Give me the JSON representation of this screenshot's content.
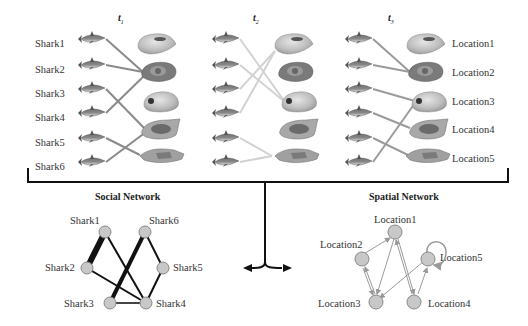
{
  "time_panels": [
    {
      "label": "t",
      "sub": "1"
    },
    {
      "label": "t",
      "sub": "2"
    },
    {
      "label": "t",
      "sub": "3"
    }
  ],
  "sharks": [
    "Shark1",
    "Shark2",
    "Shark3",
    "Shark4",
    "Shark5",
    "Shark6"
  ],
  "locations": [
    "Location1",
    "Location2",
    "Location3",
    "Location4",
    "Location5"
  ],
  "assignments": {
    "t1": [
      {
        "shark": "Shark1",
        "location": "Location2"
      },
      {
        "shark": "Shark2",
        "location": "Location2"
      },
      {
        "shark": "Shark3",
        "location": "Location4"
      },
      {
        "shark": "Shark4",
        "location": "Location2"
      },
      {
        "shark": "Shark5",
        "location": "Location5"
      },
      {
        "shark": "Shark6",
        "location": "Location4"
      }
    ],
    "t2": [
      {
        "shark": "Shark1",
        "location": "Location3"
      },
      {
        "shark": "Shark2",
        "location": "Location3"
      },
      {
        "shark": "Shark3",
        "location": "Location1"
      },
      {
        "shark": "Shark4",
        "location": "Location1"
      },
      {
        "shark": "Shark5",
        "location": "Location5"
      },
      {
        "shark": "Shark6",
        "location": "Location5"
      }
    ],
    "t3": [
      {
        "shark": "Shark1",
        "location": "Location2"
      },
      {
        "shark": "Shark2",
        "location": "Location2"
      },
      {
        "shark": "Shark3",
        "location": "Location3"
      },
      {
        "shark": "Shark4",
        "location": "Location4"
      },
      {
        "shark": "Shark5",
        "location": "Location5"
      },
      {
        "shark": "Shark6",
        "location": "Location3"
      }
    ]
  },
  "social_network": {
    "title": "Social Network",
    "nodes": [
      "Shark1",
      "Shark2",
      "Shark3",
      "Shark4",
      "Shark5",
      "Shark6"
    ],
    "edges": [
      {
        "from": "Shark1",
        "to": "Shark2",
        "weight": 3
      },
      {
        "from": "Shark1",
        "to": "Shark4",
        "weight": 1
      },
      {
        "from": "Shark2",
        "to": "Shark4",
        "weight": 1
      },
      {
        "from": "Shark3",
        "to": "Shark6",
        "weight": 2
      },
      {
        "from": "Shark3",
        "to": "Shark4",
        "weight": 1
      },
      {
        "from": "Shark6",
        "to": "Shark5",
        "weight": 1
      },
      {
        "from": "Shark5",
        "to": "Shark4",
        "weight": 1
      }
    ]
  },
  "spatial_network": {
    "title": "Spatial Network",
    "nodes": [
      "Location1",
      "Location2",
      "Location3",
      "Location4",
      "Location5"
    ],
    "edges": [
      {
        "from": "Location2",
        "to": "Location1"
      },
      {
        "from": "Location2",
        "to": "Location3"
      },
      {
        "from": "Location3",
        "to": "Location2"
      },
      {
        "from": "Location1",
        "to": "Location3"
      },
      {
        "from": "Location1",
        "to": "Location4"
      },
      {
        "from": "Location4",
        "to": "Location1"
      },
      {
        "from": "Location5",
        "to": "Location3"
      },
      {
        "from": "Location4",
        "to": "Location5"
      },
      {
        "from": "Location5",
        "to": "Location5"
      }
    ]
  },
  "colors": {
    "t1_link": "#8a8a8a",
    "t2_link": "#cfcfcf",
    "t3_link": "#9a9a9a",
    "node_fill": "#c8c8c8",
    "node_stroke": "#888888",
    "edge": "#111111",
    "spatial_edge": "#9a9a9a"
  }
}
